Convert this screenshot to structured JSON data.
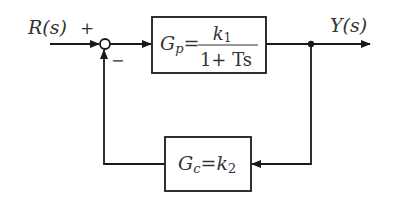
{
  "diagram": {
    "input_label": "R(s)",
    "output_label": "Y(s)",
    "plus_sign": "+",
    "minus_sign": "−",
    "forward_block": {
      "name": "Gp",
      "lhs_main": "G",
      "lhs_sub": "p",
      "equals": "=",
      "numerator": "k",
      "numerator_sub": "1",
      "denominator": "1+ Ts"
    },
    "feedback_block": {
      "name": "Gc",
      "lhs_main": "G",
      "lhs_sub": "c",
      "equals": "=",
      "rhs_main": "k",
      "rhs_sub": "2"
    }
  }
}
